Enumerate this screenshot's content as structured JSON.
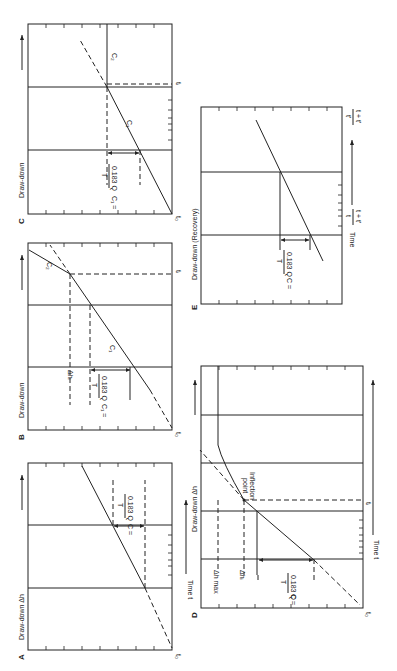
{
  "figure": {
    "orientation": "rotated 90deg clockwise",
    "panels": [
      {
        "id": "A",
        "panel_label": "A",
        "y_axis": "Draw-down Δh",
        "x_axis": "Time t",
        "origin_label": "t₀",
        "slope_label": "C = ",
        "slope_formula": {
          "numerator": "0.183 Q",
          "denominator": "T"
        }
      },
      {
        "id": "B",
        "panel_label": "B",
        "y_axis": "Draw-down",
        "origin_label": "t₀",
        "break_label": "tᵢ",
        "segment_labels": [
          "C₁",
          "C₂"
        ],
        "delta_label": "Δhᵢ",
        "slope_label": "C₁ = ",
        "slope_formula": {
          "numerator": "0.183 Q",
          "denominator": "T"
        }
      },
      {
        "id": "C",
        "panel_label": "C",
        "y_axis": "Draw-down",
        "origin_label": "t₀",
        "break_label": "tᵢ",
        "segment_labels": [
          "C₁",
          "C₂"
        ],
        "slope_label": "C₁ = ",
        "slope_formula": {
          "numerator": "0.183 Q",
          "denominator": "T"
        }
      },
      {
        "id": "D",
        "panel_label": "D",
        "y_axis": "Draw-down Δh",
        "x_axis": "Time t",
        "origin_label": "t₀",
        "break_label": "tᵢ",
        "annotation": "Inflection point",
        "annotation_line2": "point",
        "annotation_line1": "Inflection",
        "delta_max_label": "Δh max",
        "delta_label": "Δhᵢ",
        "slope_label": "C = ",
        "slope_formula": {
          "numerator": "0.183 Q",
          "denominator": "T"
        }
      },
      {
        "id": "E",
        "panel_label": "E",
        "y_axis": "Draw-down (Recovery)",
        "x_axis": "Time",
        "x_left_label": {
          "numerator": "t + t'",
          "denominator": "t"
        },
        "x_right_label": {
          "numerator": "t + t'",
          "denominator": "t'"
        },
        "slope_label": "C = ",
        "slope_formula": {
          "numerator": "0.183 Q",
          "denominator": "T"
        }
      }
    ]
  }
}
